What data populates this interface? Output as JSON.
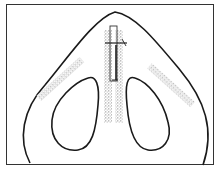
{
  "diagram": {
    "elements": [
      {
        "name": "nasal-outline",
        "type": "outline"
      },
      {
        "name": "left-nostril",
        "type": "outline"
      },
      {
        "name": "right-nostril",
        "type": "outline"
      },
      {
        "name": "columella-graft",
        "type": "stippled-strip"
      },
      {
        "name": "left-alar-graft",
        "type": "stippled-strip"
      },
      {
        "name": "right-alar-graft",
        "type": "stippled-strip"
      },
      {
        "name": "strut-bar",
        "type": "rectangle"
      },
      {
        "name": "suture-line",
        "type": "line"
      }
    ],
    "colors": {
      "line": "#1a1a1a",
      "stipple": "#888888",
      "border": "#333333"
    }
  }
}
